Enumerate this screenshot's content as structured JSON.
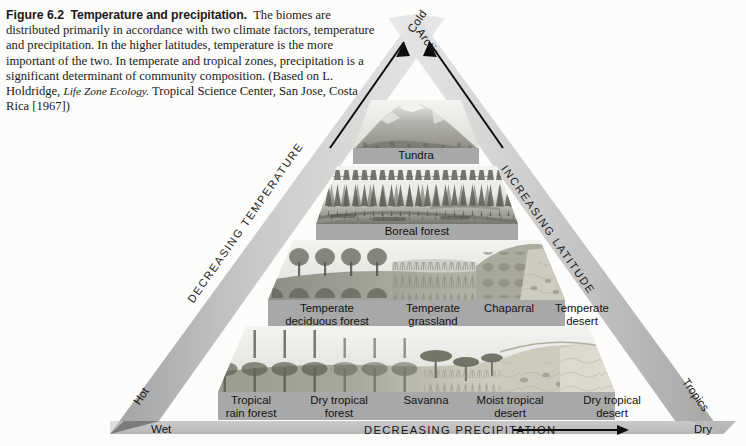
{
  "figure": {
    "number": "Figure 6.2",
    "title": "Temperature and precipitation.",
    "body": "The biomes are distributed primarily in accordance with two climate factors, temperature and precipitation. In the higher latitudes, temperature is the more important of the two. In temperate and tropical zones, precipitation is a significant determinant of community composition. (Based on L. Holdridge, ",
    "italic_source": "Life Zone Ecology.",
    "body_tail": " Tropical Science Center, San Jose, Costa Rica [1967])"
  },
  "diagram": {
    "left_edge_label": "DECREASING TEMPERATURE",
    "right_edge_label": "INCREASING LATITUDE",
    "bottom_axis_label": "DECREASING PRECIPITATION",
    "apex_left_label": "Cold",
    "apex_right_label": "Arctic",
    "corner_bottom_left_edge": "Hot",
    "corner_bottom_left_axis": "Wet",
    "corner_bottom_right_edge": "Tropics",
    "corner_bottom_right_axis": "Dry",
    "arrow_left_name": "increasing-temperature-arrow",
    "arrow_right_name": "increasing-latitude-arrow",
    "arrow_bottom_name": "decreasing-precipitation-arrow"
  },
  "bands": [
    {
      "name": "tundra-band",
      "biomes": [
        {
          "line1": "Tundra",
          "line2": ""
        }
      ]
    },
    {
      "name": "boreal-band",
      "biomes": [
        {
          "line1": "Boreal forest",
          "line2": ""
        }
      ]
    },
    {
      "name": "temperate-band",
      "biomes": [
        {
          "line1": "Temperate",
          "line2": "deciduous forest"
        },
        {
          "line1": "Temperate",
          "line2": "grassland"
        },
        {
          "line1": "Chaparral",
          "line2": ""
        },
        {
          "line1": "Temperate",
          "line2": "desert"
        }
      ]
    },
    {
      "name": "tropical-band",
      "biomes": [
        {
          "line1": "Tropical",
          "line2": "rain forest"
        },
        {
          "line1": "Dry tropical",
          "line2": "forest"
        },
        {
          "line1": "Savanna",
          "line2": ""
        },
        {
          "line1": "Moist tropical",
          "line2": "desert"
        },
        {
          "line1": "Dry tropical",
          "line2": "desert"
        }
      ]
    }
  ],
  "colors": {
    "edge_band": "#b9b9b9",
    "label_bar": "#a8a8a8",
    "axis_bar": "#bdbdbd",
    "ink": "#111111",
    "paper": "#fcfcfb"
  }
}
